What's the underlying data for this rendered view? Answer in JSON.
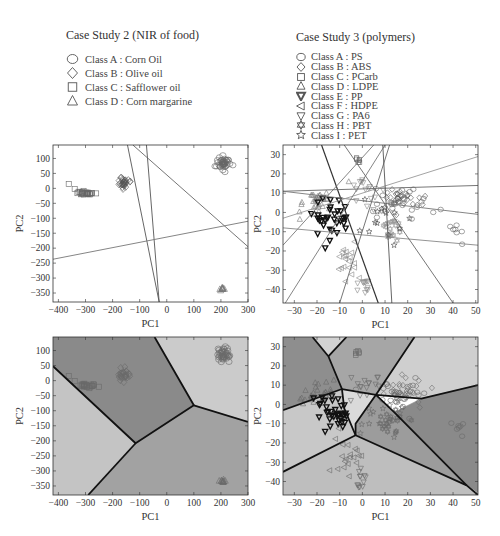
{
  "legends": [
    {
      "title": "Case Study 2 (NIR of food)",
      "items": [
        {
          "marker": "circle",
          "label": "Class A : Corn Oil"
        },
        {
          "marker": "diamond",
          "label": "Class B : Olive oil"
        },
        {
          "marker": "square",
          "label": "Class C : Safflower oil"
        },
        {
          "marker": "triangle-up",
          "label": "Class D : Corn margarine"
        }
      ]
    },
    {
      "title": "Case Study 3 (polymers)",
      "items": [
        {
          "marker": "circle",
          "label": "Class A : PS"
        },
        {
          "marker": "diamond",
          "label": "Class B : ABS"
        },
        {
          "marker": "square",
          "label": "Class C : PCarb"
        },
        {
          "marker": "triangle-up",
          "label": "Class D : LDPE"
        },
        {
          "marker": "triangle-down-bold",
          "label": "Class E : PP"
        },
        {
          "marker": "triangle-left",
          "label": "Class F : HDPE"
        },
        {
          "marker": "triangle-down",
          "label": "Class G : PA6"
        },
        {
          "marker": "hexagram",
          "label": "Class H : PBT"
        },
        {
          "marker": "star",
          "label": "Class I : PET"
        }
      ]
    }
  ],
  "chart_data": [
    {
      "id": "food-lines",
      "type": "scatter",
      "title": "Case Study 2 (NIR of food)",
      "xlabel": "PC1",
      "ylabel": "PC2",
      "xlim": [
        -420,
        300
      ],
      "ylim": [
        -380,
        145
      ],
      "xticks": [
        -400,
        -300,
        -200,
        -100,
        0,
        100,
        200,
        300
      ],
      "yticks": [
        100,
        50,
        0,
        -50,
        -100,
        -150,
        -200,
        -250,
        -300,
        -350
      ],
      "background": "#ffffff",
      "clusters": [
        {
          "class": "A",
          "marker": "circle",
          "cx": 210,
          "cy": 85,
          "sx": 12,
          "sy": 12,
          "n": 40
        },
        {
          "class": "B",
          "marker": "diamond",
          "cx": -160,
          "cy": 18,
          "sx": 10,
          "sy": 11,
          "n": 30
        },
        {
          "class": "C",
          "marker": "square",
          "cx": -300,
          "cy": -15,
          "sx": 20,
          "sy": 3,
          "n": 25
        },
        {
          "class": "D",
          "marker": "triangle-up",
          "cx": 205,
          "cy": -333,
          "sx": 5,
          "sy": 3,
          "n": 10
        }
      ],
      "extra_points": [
        {
          "marker": "square",
          "x": -362,
          "y": 15
        },
        {
          "marker": "square",
          "x": -340,
          "y": -2
        }
      ],
      "lines": [
        {
          "x1": -145,
          "y1": 145,
          "x2": -28,
          "y2": -380,
          "color": "#555"
        },
        {
          "x1": -75,
          "y1": 145,
          "x2": -28,
          "y2": -380,
          "color": "#555"
        },
        {
          "x1": -125,
          "y1": 145,
          "x2": 300,
          "y2": -195,
          "color": "#666"
        },
        {
          "x1": -420,
          "y1": -237,
          "x2": 300,
          "y2": -110,
          "color": "#777"
        }
      ]
    },
    {
      "id": "polymer-lines",
      "type": "scatter",
      "title": "Case Study 3 (polymers)",
      "xlabel": "PC1",
      "ylabel": "PC2",
      "xlim": [
        -35,
        51
      ],
      "ylim": [
        -47,
        35
      ],
      "xticks": [
        -30,
        -20,
        -10,
        0,
        10,
        20,
        30,
        40,
        50
      ],
      "yticks": [
        30,
        20,
        10,
        0,
        -10,
        -20,
        -30,
        -40
      ],
      "background": "#ffffff",
      "clusters": [
        {
          "class": "A",
          "marker": "circle",
          "cx": 18,
          "cy": 5,
          "sx": 6,
          "sy": 4,
          "n": 30
        },
        {
          "class": "A2",
          "marker": "circle",
          "cx": 42,
          "cy": -10,
          "sx": 1.5,
          "sy": 2,
          "n": 6
        },
        {
          "class": "B",
          "marker": "diamond",
          "cx": 18,
          "cy": 8,
          "sx": 5,
          "sy": 3,
          "n": 25
        },
        {
          "class": "C",
          "marker": "square",
          "cx": -2,
          "cy": 27,
          "sx": 0.6,
          "sy": 1,
          "n": 6
        },
        {
          "class": "D",
          "marker": "triangle-up",
          "cx": -20,
          "cy": 5,
          "sx": 4,
          "sy": 3,
          "n": 30
        },
        {
          "class": "E",
          "marker": "triangle-down-bold",
          "cx": -13,
          "cy": -3,
          "sx": 4,
          "sy": 5,
          "n": 35
        },
        {
          "class": "F",
          "marker": "triangle-left",
          "cx": -7,
          "cy": -25,
          "sx": 3,
          "sy": 6,
          "n": 20
        },
        {
          "class": "G",
          "marker": "triangle-down",
          "cx": 1,
          "cy": 10,
          "sx": 3,
          "sy": 4,
          "n": 15
        },
        {
          "class": "G2",
          "marker": "triangle-down",
          "cx": 0,
          "cy": -38,
          "sx": 1.5,
          "sy": 3,
          "n": 12
        },
        {
          "class": "H",
          "marker": "hexagram",
          "cx": 12,
          "cy": -8,
          "sx": 3,
          "sy": 4,
          "n": 20
        },
        {
          "class": "I",
          "marker": "star",
          "cx": 8,
          "cy": -5,
          "sx": 6,
          "sy": 5,
          "n": 12
        }
      ],
      "extra_points": [
        {
          "marker": "circle",
          "x": 44,
          "y": -16.5
        },
        {
          "marker": "star",
          "x": 3,
          "y": -10
        },
        {
          "marker": "star",
          "x": 14,
          "y": -17
        },
        {
          "marker": "triangle-up",
          "x": -6,
          "y": 16
        }
      ],
      "lines": [
        {
          "x1": -18,
          "y1": 35,
          "x2": 7,
          "y2": -47,
          "color": "#333",
          "w": 1.2
        },
        {
          "x1": -35,
          "y1": -17,
          "x2": 5,
          "y2": 35,
          "color": "#777"
        },
        {
          "x1": -35,
          "y1": 11,
          "x2": 51,
          "y2": 14,
          "color": "#666"
        },
        {
          "x1": -35,
          "y1": 11,
          "x2": 51,
          "y2": -1,
          "color": "#777"
        },
        {
          "x1": -35,
          "y1": -8,
          "x2": 51,
          "y2": -17,
          "color": "#888"
        },
        {
          "x1": -35,
          "y1": -3,
          "x2": 51,
          "y2": 29,
          "color": "#999"
        },
        {
          "x1": -34,
          "y1": -47,
          "x2": 10,
          "y2": 35,
          "color": "#777"
        },
        {
          "x1": -10,
          "y1": -47,
          "x2": 12,
          "y2": 35,
          "color": "#666"
        },
        {
          "x1": 9,
          "y1": 35,
          "x2": 13,
          "y2": -47,
          "color": "#555"
        },
        {
          "x1": -8,
          "y1": 35,
          "x2": 40,
          "y2": -47,
          "color": "#666"
        }
      ]
    },
    {
      "id": "food-regions",
      "type": "heatmap",
      "title": "Case Study 2 (NIR of food) decision regions",
      "xlabel": "PC1",
      "ylabel": "PC2",
      "xlim": [
        -420,
        300
      ],
      "ylim": [
        -380,
        145
      ],
      "xticks": [
        -400,
        -300,
        -200,
        -100,
        0,
        100,
        200,
        300
      ],
      "yticks": [
        100,
        50,
        0,
        -50,
        -100,
        -150,
        -200,
        -250,
        -300,
        -350
      ],
      "regions": [
        {
          "fill": "#8a8a8a",
          "points": [
            [
              -420,
              145
            ],
            [
              -45,
              145
            ],
            [
              100,
              -82
            ],
            [
              -115,
              -208
            ],
            [
              -420,
              48
            ]
          ]
        },
        {
          "fill": "#cbcbcb",
          "points": [
            [
              -45,
              145
            ],
            [
              300,
              145
            ],
            [
              300,
              -137
            ],
            [
              100,
              -82
            ]
          ]
        },
        {
          "fill": "#a2a2a2",
          "points": [
            [
              100,
              -82
            ],
            [
              300,
              -137
            ],
            [
              300,
              -380
            ],
            [
              -290,
              -380
            ],
            [
              -115,
              -208
            ]
          ]
        },
        {
          "fill": "#c4c4c4",
          "points": [
            [
              -420,
              48
            ],
            [
              -115,
              -208
            ],
            [
              -290,
              -380
            ],
            [
              -420,
              -380
            ]
          ]
        }
      ],
      "boundaries": [
        [
          [
            -420,
            48
          ],
          [
            -115,
            -208
          ],
          [
            100,
            -82
          ],
          [
            -45,
            145
          ]
        ],
        [
          [
            -115,
            -208
          ],
          [
            -290,
            -380
          ]
        ],
        [
          [
            100,
            -82
          ],
          [
            300,
            -137
          ]
        ]
      ],
      "clusters": [
        {
          "class": "A",
          "marker": "circle",
          "cx": 210,
          "cy": 85,
          "sx": 12,
          "sy": 12,
          "n": 40
        },
        {
          "class": "B",
          "marker": "diamond",
          "cx": -160,
          "cy": 18,
          "sx": 10,
          "sy": 11,
          "n": 30
        },
        {
          "class": "C",
          "marker": "square",
          "cx": -300,
          "cy": -15,
          "sx": 20,
          "sy": 3,
          "n": 25
        },
        {
          "class": "D",
          "marker": "triangle-up",
          "cx": 205,
          "cy": -333,
          "sx": 5,
          "sy": 3,
          "n": 10
        }
      ],
      "extra_points": [
        {
          "marker": "square",
          "x": -362,
          "y": 15
        },
        {
          "marker": "square",
          "x": -340,
          "y": -2
        }
      ]
    },
    {
      "id": "polymer-regions",
      "type": "heatmap",
      "title": "Case Study 3 (polymers) decision regions",
      "xlabel": "PC1",
      "ylabel": "PC2",
      "xlim": [
        -35,
        51
      ],
      "ylim": [
        -47,
        35
      ],
      "xticks": [
        -30,
        -20,
        -10,
        0,
        10,
        20,
        30,
        40,
        50
      ],
      "yticks": [
        30,
        20,
        10,
        0,
        -10,
        -20,
        -30,
        -40
      ],
      "regions": [
        {
          "fill": "#8e8e8e",
          "points": [
            [
              -35,
              35
            ],
            [
              -22,
              35
            ],
            [
              -15,
              25
            ],
            [
              -9,
              8
            ],
            [
              -35,
              -3
            ]
          ]
        },
        {
          "fill": "#d2d2d2",
          "points": [
            [
              -22,
              35
            ],
            [
              -7,
              35
            ],
            [
              -15,
              25
            ]
          ]
        },
        {
          "fill": "#a6a6a6",
          "points": [
            [
              -7,
              35
            ],
            [
              23,
              35
            ],
            [
              6,
              5
            ],
            [
              -9,
              8
            ],
            [
              -15,
              25
            ]
          ]
        },
        {
          "fill": "#cfcfcf",
          "points": [
            [
              23,
              35
            ],
            [
              51,
              35
            ],
            [
              51,
              10
            ],
            [
              26,
              3
            ],
            [
              6,
              5
            ]
          ]
        },
        {
          "fill": "#8a8a8a",
          "points": [
            [
              26,
              3
            ],
            [
              51,
              10
            ],
            [
              51,
              -46
            ],
            [
              46,
              -42
            ],
            [
              14,
              -4
            ]
          ]
        },
        {
          "fill": "#9c9c9c",
          "points": [
            [
              6,
              5
            ],
            [
              14,
              -4
            ],
            [
              46,
              -42
            ],
            [
              -3,
              -16
            ],
            [
              -3,
              -10
            ]
          ]
        },
        {
          "fill": "#dadada",
          "points": [
            [
              -9,
              8
            ],
            [
              6,
              5
            ],
            [
              -3,
              -10
            ],
            [
              -3,
              -16
            ],
            [
              -8,
              -2
            ]
          ]
        },
        {
          "fill": "#c8c8c8",
          "points": [
            [
              -35,
              -3
            ],
            [
              -9,
              8
            ],
            [
              -8,
              -2
            ],
            [
              -3,
              -16
            ],
            [
              -35,
              -35
            ]
          ]
        },
        {
          "fill": "#bebebe",
          "points": [
            [
              -35,
              -35
            ],
            [
              -3,
              -16
            ],
            [
              46,
              -42
            ],
            [
              51,
              -46
            ],
            [
              51,
              -47
            ],
            [
              -35,
              -47
            ]
          ]
        }
      ],
      "boundaries": [
        [
          [
            -22,
            35
          ],
          [
            -15,
            25
          ],
          [
            -9,
            8
          ],
          [
            -35,
            -3
          ]
        ],
        [
          [
            -7,
            35
          ],
          [
            -15,
            25
          ]
        ],
        [
          [
            -9,
            8
          ],
          [
            6,
            5
          ],
          [
            23,
            35
          ]
        ],
        [
          [
            6,
            5
          ],
          [
            26,
            3
          ],
          [
            51,
            10
          ]
        ],
        [
          [
            6,
            5
          ],
          [
            -3,
            -10
          ],
          [
            -3,
            -16
          ],
          [
            -35,
            -35
          ]
        ],
        [
          [
            -9,
            8
          ],
          [
            -8,
            -2
          ],
          [
            -3,
            -16
          ]
        ],
        [
          [
            -3,
            -16
          ],
          [
            46,
            -42
          ],
          [
            51,
            -47
          ]
        ],
        [
          [
            6,
            5
          ],
          [
            14,
            -4
          ],
          [
            46,
            -42
          ]
        ]
      ],
      "clusters": [
        {
          "class": "A",
          "marker": "circle",
          "cx": 18,
          "cy": 5,
          "sx": 6,
          "sy": 4,
          "n": 30
        },
        {
          "class": "A2",
          "marker": "circle",
          "cx": 42,
          "cy": -10,
          "sx": 1.5,
          "sy": 2,
          "n": 6
        },
        {
          "class": "B",
          "marker": "diamond",
          "cx": 18,
          "cy": 8,
          "sx": 5,
          "sy": 3,
          "n": 25
        },
        {
          "class": "C",
          "marker": "square",
          "cx": -2,
          "cy": 27,
          "sx": 0.6,
          "sy": 1,
          "n": 6
        },
        {
          "class": "D",
          "marker": "triangle-up",
          "cx": -20,
          "cy": 5,
          "sx": 4,
          "sy": 3,
          "n": 30
        },
        {
          "class": "E",
          "marker": "triangle-down-bold",
          "cx": -13,
          "cy": -3,
          "sx": 4,
          "sy": 5,
          "n": 35
        },
        {
          "class": "F",
          "marker": "triangle-left",
          "cx": -7,
          "cy": -25,
          "sx": 3,
          "sy": 6,
          "n": 20
        },
        {
          "class": "G",
          "marker": "triangle-down",
          "cx": 1,
          "cy": 10,
          "sx": 3,
          "sy": 4,
          "n": 15
        },
        {
          "class": "G2",
          "marker": "triangle-down",
          "cx": 0,
          "cy": -38,
          "sx": 1.5,
          "sy": 3,
          "n": 12
        },
        {
          "class": "H",
          "marker": "hexagram",
          "cx": 12,
          "cy": -8,
          "sx": 3,
          "sy": 4,
          "n": 20
        },
        {
          "class": "I",
          "marker": "star",
          "cx": 8,
          "cy": -5,
          "sx": 6,
          "sy": 5,
          "n": 12
        }
      ],
      "extra_points": [
        {
          "marker": "circle",
          "x": 44,
          "y": -16.5
        },
        {
          "marker": "star",
          "x": 3,
          "y": -10
        },
        {
          "marker": "star",
          "x": 14,
          "y": -17
        }
      ]
    }
  ],
  "layout": {
    "frames": [
      {
        "x": 53,
        "y": 145,
        "w": 195,
        "h": 157
      },
      {
        "x": 283,
        "y": 145,
        "w": 195,
        "h": 158
      },
      {
        "x": 53,
        "y": 337,
        "w": 195,
        "h": 158
      },
      {
        "x": 283,
        "y": 337,
        "w": 195,
        "h": 158
      }
    ]
  }
}
